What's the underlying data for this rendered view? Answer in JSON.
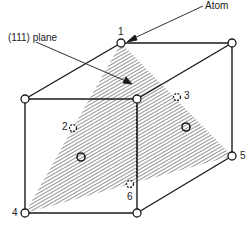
{
  "diagram": {
    "labels": {
      "atom": "Atom",
      "plane": "(111) plane",
      "n1": "1",
      "n2": "2",
      "n3": "3",
      "n4": "4",
      "n5": "5",
      "n6": "6"
    },
    "colors": {
      "line": "#1a1a1a",
      "hatch": "#444444",
      "background": "#ffffff"
    }
  }
}
